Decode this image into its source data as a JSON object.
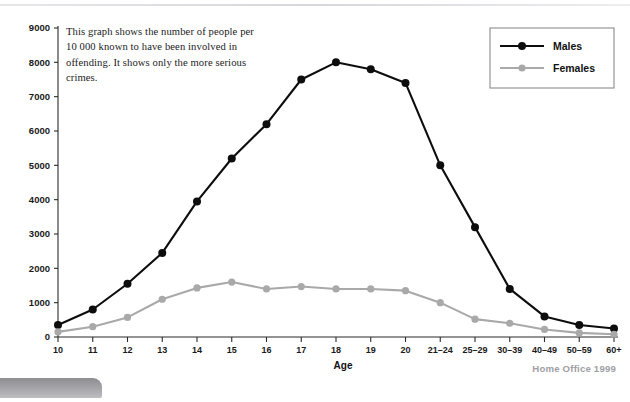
{
  "annotation": {
    "text": "This graph shows the number of people per 10 000 known to have been involved in offending. It shows only the more serious crimes."
  },
  "source": {
    "label": "Home Office 1999"
  },
  "legend": {
    "entries": [
      {
        "label": "Males",
        "color": "#0d0d0d"
      },
      {
        "label": "Females",
        "color": "#a9a9a9"
      }
    ]
  },
  "colors": {
    "males": "#0d0d0d",
    "females": "#a9a9a9",
    "axis": "#2b2b2b",
    "source_text": "#a0a0a4"
  },
  "chart_data": {
    "type": "line",
    "title": "",
    "xlabel": "Age",
    "ylabel": "",
    "ylim": [
      0,
      9000
    ],
    "yticks": [
      0,
      1000,
      2000,
      3000,
      4000,
      5000,
      6000,
      7000,
      8000,
      9000
    ],
    "ytick_labels": [
      "0",
      "1000",
      "2000",
      "3000",
      "4000",
      "5000",
      "6000",
      "7000",
      "8000",
      "9000"
    ],
    "grid": false,
    "legend_position": "top-right",
    "categories": [
      "10",
      "11",
      "12",
      "13",
      "14",
      "15",
      "16",
      "17",
      "18",
      "19",
      "20",
      "21–24",
      "25–29",
      "30–39",
      "40–49",
      "50–59",
      "60+"
    ],
    "series": [
      {
        "name": "Males",
        "color": "#0d0d0d",
        "values": [
          350,
          800,
          1550,
          2450,
          3950,
          5200,
          6200,
          7500,
          8000,
          7800,
          7400,
          5000,
          3200,
          1400,
          600,
          350,
          250
        ]
      },
      {
        "name": "Females",
        "color": "#a9a9a9",
        "values": [
          150,
          300,
          570,
          1100,
          1430,
          1600,
          1400,
          1470,
          1400,
          1400,
          1350,
          1000,
          520,
          400,
          220,
          120,
          80
        ]
      }
    ]
  }
}
